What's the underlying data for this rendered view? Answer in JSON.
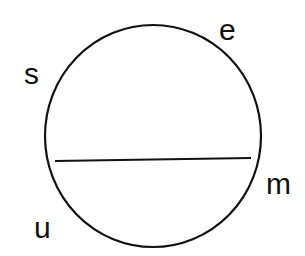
{
  "diagram": {
    "labels": {
      "s": "s",
      "e": "e",
      "m": "m",
      "u": "u"
    },
    "circle": {
      "cx": 153,
      "cy": 136,
      "rx": 108,
      "ry": 111,
      "stroke": "#111111"
    },
    "chord": {
      "x1": 55,
      "y1": 161,
      "x2": 251,
      "y2": 158,
      "stroke": "#111111"
    }
  }
}
